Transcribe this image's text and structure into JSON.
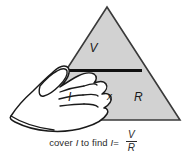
{
  "figure": {
    "name": "ohms-law-triangle",
    "background_color": "#ffffff",
    "triangle": {
      "fill_color": "#d2d2d2",
      "stroke_color": "#3a3a3a",
      "divider_color": "#111111",
      "apex": {
        "x": 107,
        "y": 7
      },
      "base_left": {
        "x": 34,
        "y": 120
      },
      "base_right": {
        "x": 180,
        "y": 120
      },
      "divider": {
        "x1": 68,
        "y1": 70,
        "x2": 142,
        "y2": 70
      }
    },
    "labels": {
      "top": "V",
      "bottom_left": "I",
      "operator": "x",
      "bottom_right": "R"
    },
    "hand": {
      "fill_color": "#ffffff",
      "stroke_color": "#1a1a1a",
      "covers": "I"
    },
    "caption": {
      "prefix": "cover ",
      "covered_symbol": "I",
      "middle": " to find ",
      "result_symbol": "I",
      "equals": "=",
      "fraction_numerator": "V",
      "fraction_denominator": "R",
      "full_text": "cover I to find I= V/R"
    }
  }
}
